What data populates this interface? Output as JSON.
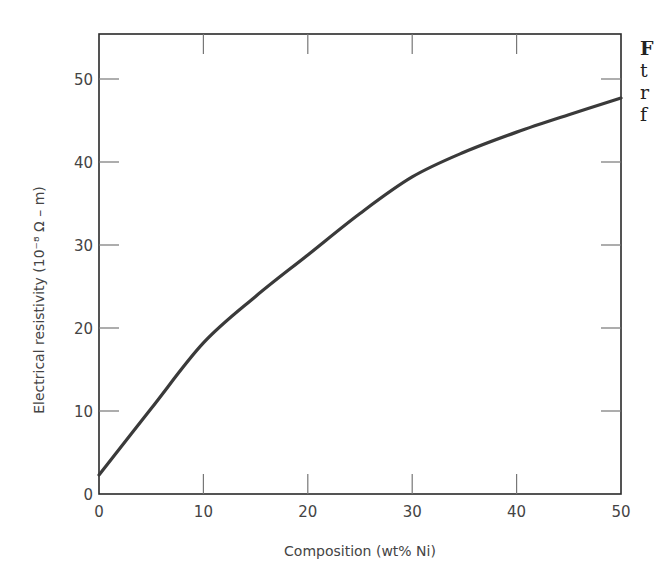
{
  "chart_data": {
    "type": "line",
    "title": "",
    "xlabel": "Composition (wt% Ni)",
    "ylabel": "Electrical resistivity (10⁻⁸ Ω – m)",
    "xlim": [
      0,
      50
    ],
    "ylim": [
      0,
      55
    ],
    "x_ticks": [
      0,
      10,
      20,
      30,
      40,
      50
    ],
    "x_tick_labels": [
      "0",
      "10",
      "20",
      "30",
      "40",
      "50"
    ],
    "y_ticks": [
      0,
      10,
      20,
      30,
      40,
      50
    ],
    "y_tick_labels": [
      "0",
      "10",
      "20",
      "30",
      "40",
      "50"
    ],
    "grid": false,
    "legend": null,
    "series": [
      {
        "name": "Resistivity",
        "x": [
          0,
          5,
          10,
          15,
          20,
          25,
          30,
          35,
          40,
          45,
          50
        ],
        "y": [
          2.3,
          10.3,
          18.2,
          23.8,
          28.8,
          33.8,
          38.2,
          41.2,
          43.6,
          45.7,
          47.7
        ]
      }
    ]
  },
  "caption_fragments": [
    "F",
    "t",
    "r",
    "f"
  ],
  "colors": {
    "curve": "#3a3a3a",
    "axis": "#2a2a2a",
    "tick": "#777777",
    "text": "#444444"
  }
}
